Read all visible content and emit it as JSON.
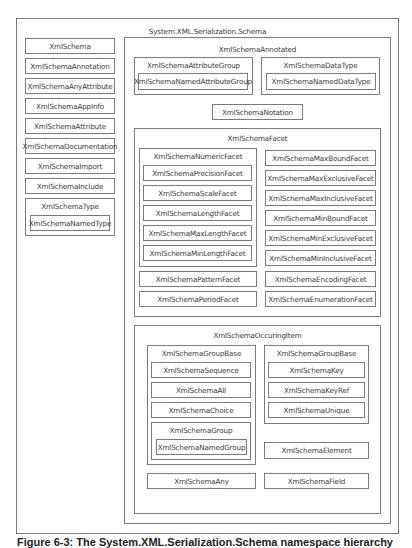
{
  "diagram": {
    "root": "System.XML.Serialization.Schema",
    "left_column": [
      "XmlSchema",
      "XmlSchemaAnnotation",
      "XmlSchemaAnyAttribute",
      "XmlSchemaAppInfo",
      "XmlSchemaAttribute",
      "XmlSchemaDocumentation",
      "XmlSchemaImport",
      "XmlSchemaInclude"
    ],
    "schema_type": {
      "label": "XmlSchemaType",
      "child": "XmlSchemaNamedType"
    },
    "annotated": {
      "label": "XmlSchemaAnnotated",
      "attribute_group": {
        "label": "XmlSchemaAttributeGroup",
        "child": "XmlSchemaNamedAttributeGroup"
      },
      "data_type": {
        "label": "XmlSchemaDataType",
        "child": "XmlSchemaNamedDataType"
      },
      "notation": "XmlSchemaNotation",
      "facet": {
        "label": "XmlSchemaFacet",
        "numeric": {
          "label": "XmlSchemaNumericFacet",
          "children": [
            "XmlSchemaPrecisionFacet",
            "XmlSchemaScaleFacet",
            "XmlSchemaLengthFacet",
            "XmlSchemaMaxLengthFacet",
            "XmlSchemaMinLengthFacet"
          ]
        },
        "pattern": "XmlSchemaPatternFacet",
        "period": "XmlSchemaPeriodFacet",
        "right": [
          "XmlSchemaMaxBoundFacet",
          "XmlSchemaMaxExclusiveFacet",
          "XmlSchemaMaxInclusiveFacet",
          "XmlSchemaMinBoundFacet",
          "XmlSchemaMinExclusiveFacet",
          "XmlSchemaMinInclusiveFacet",
          "XmlSchemaEncodingFacet",
          "XmlSchemaEnumerationFacet"
        ]
      },
      "occuring": {
        "label": "XmlSchemaOccuringItem",
        "group_base_left": {
          "label": "XmlSchemaGroupBase",
          "children": [
            "XmlSchemaSequence",
            "XmlSchemaAll",
            "XmlSchemaChoice"
          ],
          "group": {
            "label": "XmlSchemaGroup",
            "child": "XmlSchemaNamedGroup"
          }
        },
        "group_base_right": {
          "label": "XmlSchemaGroupBase",
          "children": [
            "XmlSchemaKey",
            "XmlSchemaKeyRef",
            "XmlSchemaUnique"
          ]
        },
        "element": "XmlSchemaElement",
        "any": "XmlSchemaAny",
        "field": "XmlSchemaField"
      }
    }
  },
  "caption": "Figure 6-3: The System.XML.Serialization.Schema namespace hierarchy"
}
